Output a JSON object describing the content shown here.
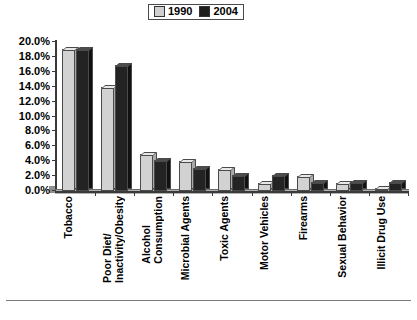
{
  "legend": {
    "entries": [
      {
        "label": "1990",
        "color": "#cfcfcf",
        "name": "legend-swatch-1990"
      },
      {
        "label": "2004",
        "color": "#1e1e1e",
        "name": "legend-swatch-2004"
      }
    ]
  },
  "footer": {
    "ghost_text": ""
  },
  "chart_data": {
    "type": "bar",
    "title": "",
    "xlabel": "",
    "ylabel": "",
    "ylim": [
      0,
      20
    ],
    "ytick_labels": [
      "20.0%",
      "18.0%",
      "16.0%",
      "14.0%",
      "12.0%",
      "10.0%",
      "8.0%",
      "6.0%",
      "4.0%",
      "2.0%",
      "0.0%"
    ],
    "ytick_values": [
      20,
      18,
      16,
      14,
      12,
      10,
      8,
      6,
      4,
      2,
      0
    ],
    "grid": false,
    "legend_position": "top-center",
    "categories": [
      "Tobacco",
      "Poor Diet/\nInactivity/Obesity",
      "Alcohol\nConsumption",
      "Microbial Agents",
      "Toxic Agents",
      "Motor Vehicles",
      "Firearms",
      "Sexual Behavior",
      "Illicit Drug Use"
    ],
    "series": [
      {
        "name": "1990",
        "color": "#d2d2d2",
        "values": [
          19.0,
          14.0,
          5.0,
          4.0,
          3.0,
          1.1,
          2.0,
          1.1,
          0.4
        ]
      },
      {
        "name": "2004",
        "color": "#232323",
        "values": [
          19.1,
          16.9,
          4.2,
          3.1,
          2.2,
          2.1,
          1.2,
          1.2,
          1.2
        ]
      }
    ]
  }
}
